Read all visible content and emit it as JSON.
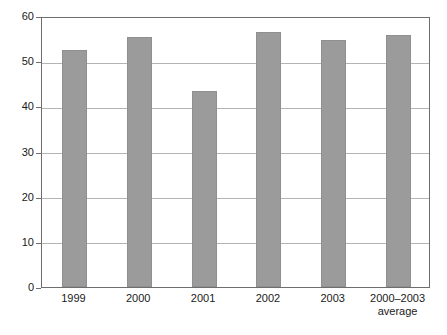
{
  "chart_data": {
    "type": "bar",
    "title": "",
    "subtitle": "",
    "xlabel": "",
    "ylabel": "",
    "categories": [
      "1999",
      "2000",
      "2001",
      "2002",
      "2003",
      "2000–2003\naverage"
    ],
    "values": [
      52.4,
      55.3,
      43.5,
      56.4,
      54.6,
      55.7
    ],
    "ylim": [
      0,
      60
    ],
    "yticks": [
      0,
      10,
      20,
      30,
      40,
      50,
      60
    ],
    "ytick_labels": [
      "0",
      "10",
      "20",
      "30",
      "40",
      "50",
      "60"
    ],
    "grid": true,
    "grid_axis": "y",
    "legend": false,
    "legend_position": "none",
    "bar_color": "#9b9b9b",
    "gridline_color": "#b4b4b4",
    "frame_color": "#6e6e6e",
    "background_color": "#ffffff",
    "text_color": "#1a1a1a",
    "series": [
      {
        "name": "",
        "values": [
          52.4,
          55.3,
          43.5,
          56.4,
          54.6,
          55.7
        ]
      }
    ]
  }
}
